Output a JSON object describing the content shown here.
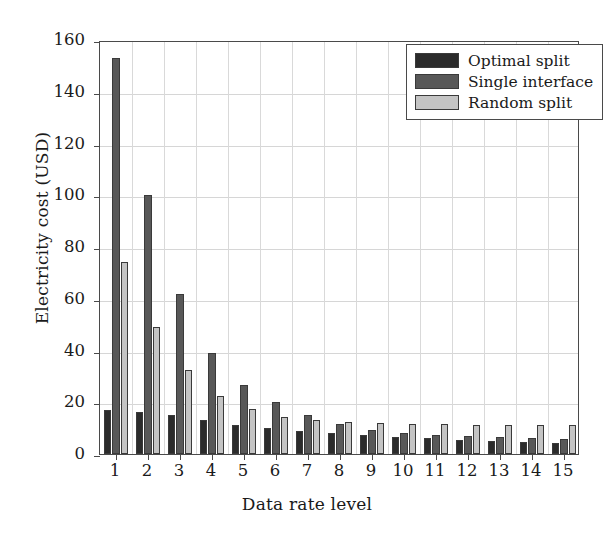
{
  "chart_data": {
    "type": "bar",
    "title": "",
    "xlabel": "Data rate level",
    "ylabel": "Electricity cost (USD)",
    "categories": [
      "1",
      "2",
      "3",
      "4",
      "5",
      "6",
      "7",
      "8",
      "9",
      "10",
      "11",
      "12",
      "13",
      "14",
      "15"
    ],
    "series": [
      {
        "name": "Optimal split",
        "color": "#2b2b2b",
        "values": [
          17.2,
          16.2,
          15.0,
          13.2,
          11.3,
          10.0,
          8.8,
          8.2,
          7.3,
          6.6,
          6.0,
          5.5,
          4.9,
          4.6,
          4.3
        ]
      },
      {
        "name": "Single interface",
        "color": "#585858",
        "values": [
          153.0,
          100.0,
          62.0,
          39.2,
          26.8,
          20.2,
          15.0,
          11.6,
          9.4,
          8.2,
          7.4,
          6.8,
          6.4,
          6.1,
          5.8
        ]
      },
      {
        "name": "Random split",
        "color": "#c4c4c4",
        "values": [
          74.4,
          49.1,
          32.6,
          22.6,
          17.4,
          14.4,
          13.0,
          12.2,
          11.8,
          11.6,
          11.5,
          11.4,
          11.3,
          11.3,
          11.2
        ]
      }
    ],
    "ylim": [
      0,
      160
    ],
    "yticks": [
      0,
      20,
      40,
      60,
      80,
      100,
      120,
      140,
      160
    ],
    "ytick_labels": [
      "0",
      "20",
      "40",
      "60",
      "80",
      "100",
      "120",
      "140",
      "160"
    ],
    "grid": true,
    "grid_color": "#d6d6d6",
    "legend_position": "top-right",
    "axis_color": "#4a4a4a"
  }
}
